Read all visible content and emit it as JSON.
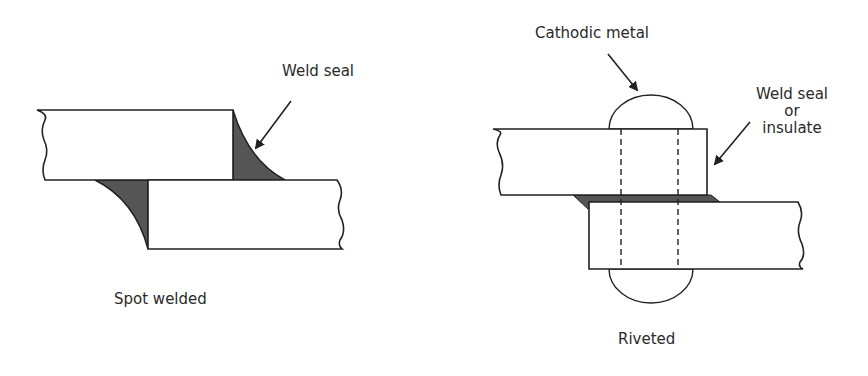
{
  "figures": [
    {
      "id": "spot-welded",
      "caption": "Spot welded",
      "callouts": [
        {
          "label": "Weld seal"
        }
      ]
    },
    {
      "id": "riveted",
      "caption": "Riveted",
      "callouts": [
        {
          "label": "Cathodic metal"
        },
        {
          "label_lines": [
            "Weld seal",
            "or",
            "insulate"
          ]
        }
      ]
    }
  ],
  "colors": {
    "line": "#222222",
    "weld_fill": "#555555",
    "background": "#ffffff"
  }
}
